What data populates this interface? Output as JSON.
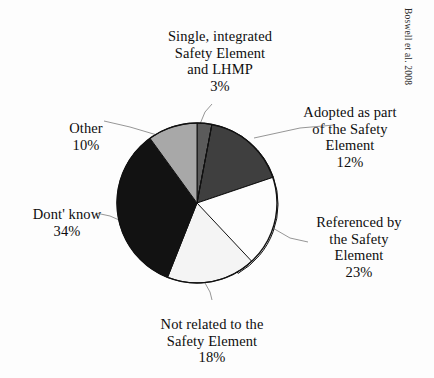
{
  "figure": {
    "credit": "Boswell et al. 2008",
    "background_color": "#fdfdfd"
  },
  "chart_data": {
    "type": "pie",
    "title": "",
    "xlabel": "",
    "ylabel": "",
    "legend_position": "none",
    "grid": false,
    "units": "percent",
    "total": 100,
    "start_angle_deg": 0,
    "direction": "clockwise",
    "categories": [
      "Single, integrated Safety Element and LHMP",
      "Adopted as part of the Safety Element",
      "Referenced by the Safety Element",
      "Not related to the Safety Element",
      "Dont' know",
      "Other"
    ],
    "values": [
      3,
      12,
      23,
      18,
      34,
      10
    ],
    "slices": [
      {
        "key": "single-integrated",
        "label_lines": "Single, integrated\nSafety Element\nand LHMP",
        "value": 3,
        "percent_text": "3%",
        "color": "#5b5b5b"
      },
      {
        "key": "adopted-as-part",
        "label_lines": "Adopted as part\nof the Safety\nElement",
        "value": 12,
        "percent_text": "12%",
        "color": "#3f3f3f"
      },
      {
        "key": "referenced-by",
        "label_lines": "Referenced by\nthe Safety\nElement",
        "value": 23,
        "percent_text": "23%",
        "color": "#fdfdfd"
      },
      {
        "key": "not-related",
        "label_lines": "Not related to the\nSafety Element",
        "value": 18,
        "percent_text": "18%",
        "color": "#f4f4f4"
      },
      {
        "key": "dont-know",
        "label_lines": "Dont' know",
        "value": 34,
        "percent_text": "34%",
        "color": "#121212"
      },
      {
        "key": "other",
        "label_lines": "Other",
        "value": 10,
        "percent_text": "10%",
        "color": "#a8a8a8"
      }
    ],
    "geometry": {
      "center_x": 197,
      "center_y": 203,
      "radius": 80,
      "outline_color": "#111111"
    }
  }
}
